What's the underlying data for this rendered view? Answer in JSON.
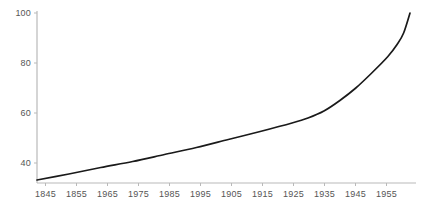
{
  "chart_data": {
    "type": "line",
    "title": "",
    "subtitle": "",
    "xlabel": "",
    "ylabel": "",
    "grid": false,
    "legend": false,
    "legend_position": "none",
    "line_color": "#1a1a1a",
    "axis_color": "#b9b9b9",
    "tick_label_color": "#555555",
    "background_color": "#ffffff",
    "xlim": [
      1845,
      1962
    ],
    "ylim": [
      33,
      101
    ],
    "y_ticks": [
      40,
      60,
      80,
      100
    ],
    "y_tick_labels": [
      "40",
      "60",
      "80",
      "100"
    ],
    "x_ticks": [
      1845,
      1855,
      1965,
      1975,
      1985,
      1995,
      1905,
      1915,
      1925,
      1935,
      1945,
      1955
    ],
    "x_tick_labels": [
      "1845",
      "1855",
      "1965",
      "1975",
      "1985",
      "1995",
      "1905",
      "1915",
      "1925",
      "1935",
      "1945",
      "1955"
    ],
    "series": [
      {
        "name": "value",
        "x": [
          1845,
          1855,
          1865,
          1875,
          1885,
          1895,
          1905,
          1915,
          1925,
          1930,
          1935,
          1940,
          1945,
          1950,
          1955,
          1958,
          1960,
          1962
        ],
        "values": [
          33.2,
          35.6,
          38.2,
          40.6,
          43.4,
          46.2,
          49.4,
          52.6,
          56.0,
          58.0,
          60.8,
          65.0,
          70.0,
          76.0,
          82.5,
          87.5,
          92.0,
          100.0
        ]
      }
    ],
    "annotations": []
  },
  "axes": {
    "y_axis_name": "y-axis",
    "x_axis_name": "x-axis"
  }
}
